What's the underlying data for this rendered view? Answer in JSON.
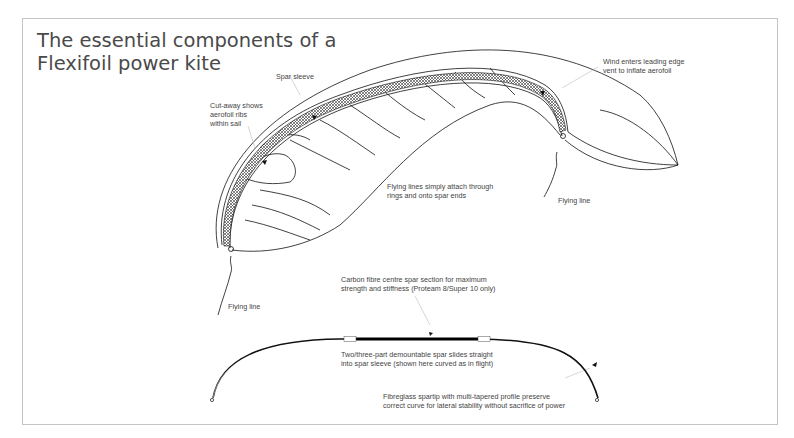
{
  "title": {
    "line1": "The essential components of a",
    "line2": "Flexifoil power kite"
  },
  "kite_labels": {
    "spar_sleeve": "Spar sleeve",
    "cutaway": [
      "Cut-away shows",
      "aerofoil ribs",
      "within sail"
    ],
    "wind_vent": [
      "Wind enters leading edge",
      "vent to inflate aerofoil"
    ],
    "flying_lines_attach": [
      "Flying lines simply attach through",
      "rings and onto spar ends"
    ],
    "flying_line_left": "Flying line",
    "flying_line_right": "Flying line"
  },
  "spar_labels": {
    "carbon_centre": [
      "Carbon fibre centre spar section for maximum",
      "strength and stiffness (Proteam 8/Super 10 only)"
    ],
    "demountable": [
      "Two/three-part demountable spar slides straight",
      "into spar sleeve (shown here curved as in flight)"
    ],
    "fibreglass_tip": [
      "Fibreglass spartip with multi-tapered profile preserve",
      "correct curve for lateral stability without sacrifice of power"
    ]
  },
  "colors": {
    "frame": "#c4c4c4",
    "title": "#4a4a4a",
    "label": "#444444",
    "line": "#111111"
  }
}
